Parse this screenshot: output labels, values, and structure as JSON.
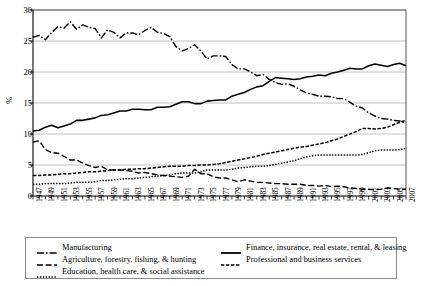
{
  "chart_data": {
    "type": "line",
    "title": "",
    "xlabel": "",
    "ylabel": "%",
    "ylim": [
      0,
      30
    ],
    "yticks": [
      0,
      5,
      10,
      15,
      20,
      25,
      30
    ],
    "xlim": [
      1947,
      2007
    ],
    "grid": "horizontal",
    "legend_position": "bottom",
    "x": [
      1947,
      1948,
      1949,
      1950,
      1951,
      1952,
      1953,
      1954,
      1955,
      1956,
      1957,
      1958,
      1959,
      1960,
      1961,
      1962,
      1963,
      1964,
      1965,
      1966,
      1967,
      1968,
      1969,
      1970,
      1971,
      1972,
      1973,
      1974,
      1975,
      1976,
      1977,
      1978,
      1979,
      1980,
      1981,
      1982,
      1983,
      1984,
      1985,
      1986,
      1987,
      1988,
      1989,
      1990,
      1991,
      1992,
      1993,
      1994,
      1995,
      1996,
      1997,
      1998,
      1999,
      2000,
      2001,
      2002,
      2003,
      2004,
      2005,
      2006,
      2007
    ],
    "xtick_labels": [
      "1947",
      "1949",
      "1951",
      "1953",
      "1955",
      "1957",
      "1959",
      "1961",
      "1963",
      "1965",
      "1967",
      "1969",
      "1971",
      "1973",
      "1975",
      "1977",
      "1979",
      "1981",
      "1983",
      "1985",
      "1987",
      "1989",
      "1991",
      "1993",
      "1995",
      "1997",
      "1999",
      "2001",
      "2003",
      "2005",
      "2007"
    ],
    "series": [
      {
        "name": "Manufacturing",
        "style": "dash-dot",
        "values": [
          25.6,
          25.9,
          25.2,
          26.4,
          27.3,
          27.1,
          28.1,
          26.9,
          27.6,
          27.2,
          27.0,
          25.5,
          26.8,
          26.4,
          25.5,
          26.3,
          26.3,
          26.0,
          26.7,
          27.2,
          26.4,
          26.2,
          25.7,
          24.1,
          23.4,
          23.8,
          24.4,
          23.4,
          22.1,
          22.6,
          22.6,
          22.5,
          21.2,
          20.5,
          20.5,
          20.0,
          19.4,
          19.6,
          18.8,
          18.3,
          18.0,
          18.1,
          17.7,
          17.1,
          16.6,
          16.4,
          16.1,
          16.1,
          16.0,
          15.7,
          15.7,
          15.1,
          14.5,
          14.2,
          13.4,
          12.9,
          12.5,
          12.4,
          12.2,
          12.1,
          11.7
        ]
      },
      {
        "name": "Finance, insurance, real estate, rental, & leasing",
        "style": "solid",
        "values": [
          10.5,
          10.6,
          11.1,
          11.4,
          11.0,
          11.3,
          11.6,
          12.2,
          12.2,
          12.4,
          12.6,
          13.0,
          13.1,
          13.4,
          13.7,
          13.7,
          14.0,
          14.0,
          13.9,
          13.9,
          14.3,
          14.3,
          14.4,
          14.8,
          15.2,
          15.2,
          14.9,
          14.9,
          15.3,
          15.4,
          15.5,
          15.5,
          16.1,
          16.4,
          16.7,
          17.2,
          17.6,
          17.8,
          18.5,
          19.1,
          19.0,
          18.9,
          18.8,
          18.9,
          19.2,
          19.3,
          19.5,
          19.4,
          19.8,
          20.0,
          20.3,
          20.6,
          20.5,
          20.5,
          21.0,
          21.3,
          21.1,
          20.9,
          21.2,
          21.4,
          21.0
        ]
      },
      {
        "name": "Agriculture, forestry, fishing, & hunting",
        "style": "dashed",
        "values": [
          8.7,
          8.9,
          7.5,
          7.0,
          6.9,
          6.4,
          5.8,
          5.8,
          5.3,
          4.9,
          4.6,
          4.8,
          4.2,
          4.2,
          4.2,
          4.1,
          4.0,
          3.7,
          3.8,
          3.6,
          3.4,
          3.3,
          3.2,
          3.1,
          3.0,
          3.2,
          4.3,
          3.6,
          3.6,
          3.1,
          2.9,
          2.9,
          2.6,
          2.3,
          2.6,
          2.4,
          2.2,
          2.2,
          2.1,
          2.0,
          2.0,
          1.9,
          1.9,
          1.9,
          1.7,
          1.7,
          1.6,
          1.7,
          1.5,
          1.6,
          1.5,
          1.3,
          1.2,
          1.1,
          1.1,
          1.0,
          1.1,
          1.3,
          1.2,
          1.1,
          1.1
        ]
      },
      {
        "name": "Professional and business services",
        "style": "dash-dot-fine",
        "values": [
          3.3,
          3.3,
          3.4,
          3.4,
          3.5,
          3.6,
          3.6,
          3.7,
          3.8,
          3.9,
          3.9,
          4.0,
          4.1,
          4.2,
          4.2,
          4.3,
          4.3,
          4.4,
          4.4,
          4.5,
          4.6,
          4.7,
          4.8,
          4.8,
          4.8,
          4.9,
          4.9,
          5.0,
          5.0,
          5.1,
          5.2,
          5.4,
          5.6,
          5.8,
          6.0,
          6.2,
          6.4,
          6.7,
          6.9,
          7.1,
          7.3,
          7.5,
          7.7,
          7.9,
          8.0,
          8.2,
          8.4,
          8.6,
          8.9,
          9.2,
          9.6,
          10.0,
          10.4,
          10.9,
          10.9,
          10.8,
          10.9,
          11.1,
          11.5,
          11.9,
          12.2
        ]
      },
      {
        "name": "Education, health care, & social assistance",
        "style": "dotted",
        "values": [
          1.9,
          1.9,
          2.0,
          2.0,
          2.0,
          2.0,
          2.1,
          2.2,
          2.2,
          2.2,
          2.3,
          2.5,
          2.5,
          2.6,
          2.7,
          2.8,
          2.8,
          2.9,
          3.0,
          3.1,
          3.2,
          3.3,
          3.4,
          3.6,
          3.7,
          3.7,
          3.7,
          3.9,
          4.2,
          4.2,
          4.2,
          4.2,
          4.3,
          4.5,
          4.6,
          4.7,
          4.8,
          4.8,
          4.9,
          5.1,
          5.3,
          5.5,
          5.7,
          6.0,
          6.3,
          6.5,
          6.6,
          6.6,
          6.6,
          6.6,
          6.6,
          6.6,
          6.6,
          6.7,
          7.0,
          7.3,
          7.4,
          7.4,
          7.4,
          7.5,
          7.7
        ]
      }
    ]
  },
  "axis": {
    "ylabel": "%"
  },
  "legend": {
    "left_column": [
      {
        "label": "Manufacturing",
        "style": "dash-dot"
      },
      {
        "label": "Agriculture, forestry, fishing, & hunting",
        "style": "dashed"
      },
      {
        "label": "Education, health care, & social assistance",
        "style": "dotted"
      }
    ],
    "right_column": [
      {
        "label": "Finance, insurance, real estate, rental, & leasing",
        "style": "solid"
      },
      {
        "label": "Professional and business services",
        "style": "dash-dot-fine"
      }
    ]
  }
}
